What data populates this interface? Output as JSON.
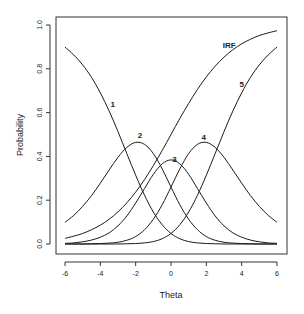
{
  "chart_data": {
    "type": "line",
    "title": "",
    "xlabel": "Theta",
    "ylabel": "Probability",
    "xlim": [
      -6,
      6
    ],
    "ylim": [
      0,
      1
    ],
    "xticks": [
      "-6",
      "-4",
      "-2",
      "0",
      "2",
      "4",
      "6"
    ],
    "xtick_values": [
      -6,
      -4,
      -2,
      0,
      2,
      4,
      6
    ],
    "yticks": [
      "0.0",
      "0.2",
      "0.4",
      "0.6",
      "0.8",
      "1.0"
    ],
    "ytick_values": [
      0,
      0.2,
      0.4,
      0.6,
      0.8,
      1.0
    ],
    "grid": false,
    "legend": "none (curves labeled inline)",
    "x": [
      -6,
      -5.5,
      -5,
      -4.5,
      -4,
      -3.5,
      -3,
      -2.5,
      -2,
      -1.5,
      -1,
      -0.5,
      0,
      0.5,
      1,
      1.5,
      2,
      2.5,
      3,
      3.5,
      4,
      4.5,
      5,
      5.5,
      6
    ],
    "series": [
      {
        "name": "1",
        "label_pos": [
          -3.3,
          0.64
        ],
        "values": [
          0.899,
          0.863,
          0.818,
          0.761,
          0.69,
          0.607,
          0.513,
          0.413,
          0.314,
          0.223,
          0.146,
          0.088,
          0.048,
          0.024,
          0.011,
          0.005,
          0.002,
          0.001,
          0.0,
          0.0,
          0.0,
          0.0,
          0.0,
          0.0,
          0.0
        ]
      },
      {
        "name": "2",
        "label_pos": [
          -1.75,
          0.5
        ],
        "values": [
          0.099,
          0.131,
          0.172,
          0.221,
          0.278,
          0.338,
          0.396,
          0.441,
          0.464,
          0.455,
          0.413,
          0.343,
          0.26,
          0.179,
          0.113,
          0.065,
          0.034,
          0.017,
          0.008,
          0.004,
          0.002,
          0.001,
          0.0,
          0.0,
          0.0
        ]
      },
      {
        "name": "3",
        "label_pos": [
          0.2,
          0.39
        ],
        "values": [
          0.003,
          0.005,
          0.01,
          0.018,
          0.031,
          0.051,
          0.083,
          0.128,
          0.187,
          0.253,
          0.318,
          0.366,
          0.384,
          0.366,
          0.318,
          0.253,
          0.187,
          0.128,
          0.083,
          0.051,
          0.031,
          0.018,
          0.01,
          0.005,
          0.003
        ]
      },
      {
        "name": "4",
        "label_pos": [
          1.85,
          0.49
        ],
        "values": [
          0.0,
          0.0,
          0.0,
          0.001,
          0.002,
          0.004,
          0.008,
          0.017,
          0.034,
          0.065,
          0.113,
          0.179,
          0.26,
          0.343,
          0.413,
          0.455,
          0.464,
          0.441,
          0.396,
          0.338,
          0.278,
          0.221,
          0.172,
          0.131,
          0.099
        ]
      },
      {
        "name": "5",
        "label_pos": [
          4.0,
          0.73
        ],
        "values": [
          0.0,
          0.0,
          0.0,
          0.0,
          0.0,
          0.0,
          0.0,
          0.001,
          0.002,
          0.005,
          0.011,
          0.024,
          0.048,
          0.088,
          0.146,
          0.223,
          0.314,
          0.413,
          0.513,
          0.607,
          0.69,
          0.761,
          0.818,
          0.863,
          0.899
        ]
      },
      {
        "name": "IRF",
        "label_pos": [
          3.3,
          0.91
        ],
        "values": [
          0.026,
          0.036,
          0.048,
          0.065,
          0.086,
          0.113,
          0.147,
          0.188,
          0.237,
          0.294,
          0.358,
          0.427,
          0.5,
          0.573,
          0.642,
          0.706,
          0.763,
          0.812,
          0.853,
          0.887,
          0.914,
          0.935,
          0.952,
          0.964,
          0.974
        ]
      }
    ]
  },
  "colors": {
    "line": "#1a1a1a",
    "axis": "#333333",
    "background": "#ffffff"
  }
}
